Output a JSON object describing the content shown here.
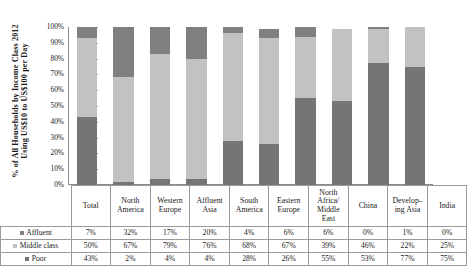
{
  "chart_data": {
    "type": "bar",
    "subtype": "100% stacked column",
    "title": "",
    "xlabel": "",
    "ylabel": "% of All Households by Income Class 2012 Using US$10 to US$100 per Day",
    "ylabel_lines": [
      "% of All Households by Income Class 2012",
      "Using US$10 to US$100 per Day"
    ],
    "ylim": [
      0,
      100
    ],
    "yticks": [
      "0%",
      "10%",
      "20%",
      "30%",
      "40%",
      "50%",
      "60%",
      "70%",
      "80%",
      "90%",
      "100%"
    ],
    "grid": false,
    "legend_position": "bottom-table",
    "categories": [
      "Total",
      "North America",
      "Western Europe",
      "Affluent Asia",
      "South America",
      "Eastern Europe",
      "North Africa/ Middle East",
      "China",
      "Developing Asia",
      "India"
    ],
    "category_lines": [
      [
        "Total"
      ],
      [
        "North",
        "America"
      ],
      [
        "Western",
        "Europe"
      ],
      [
        "Affluent",
        "Asia"
      ],
      [
        "South",
        "America"
      ],
      [
        "Eastern",
        "Europe"
      ],
      [
        "North",
        "Africa/",
        "Middle",
        "East"
      ],
      [
        "China"
      ],
      [
        "Develop–",
        "ing Asia"
      ],
      [
        "India"
      ]
    ],
    "series": [
      {
        "name": "Affluent",
        "color": "#808080",
        "stack_order": 3,
        "values": [
          7,
          32,
          17,
          20,
          4,
          6,
          6,
          0,
          1,
          0
        ],
        "labels": [
          "7%",
          "32%",
          "17%",
          "20%",
          "4%",
          "6%",
          "6%",
          "0%",
          "1%",
          "0%"
        ]
      },
      {
        "name": "Middle class",
        "color": "#c2c2c2",
        "stack_order": 2,
        "values": [
          50,
          67,
          79,
          76,
          68,
          67,
          39,
          46,
          22,
          25
        ],
        "labels": [
          "50%",
          "67%",
          "79%",
          "76%",
          "68%",
          "67%",
          "39%",
          "46%",
          "22%",
          "25%"
        ]
      },
      {
        "name": "Poor",
        "color": "#757575",
        "stack_order": 1,
        "values": [
          43,
          2,
          4,
          4,
          28,
          26,
          55,
          53,
          77,
          75
        ],
        "labels": [
          "43%",
          "2%",
          "4%",
          "4%",
          "28%",
          "26%",
          "55%",
          "53%",
          "77%",
          "75%"
        ]
      }
    ]
  },
  "colors": {
    "affluent": "#808080",
    "middle_class": "#c2c2c2",
    "poor": "#757575",
    "axis": "#8c8c8c",
    "table_border": "#9a9a9a",
    "text": "#1a1a1a"
  }
}
